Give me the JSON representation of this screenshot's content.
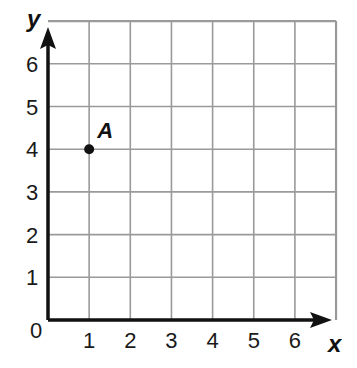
{
  "chart_data": {
    "type": "scatter",
    "title": "",
    "xlabel": "x",
    "ylabel": "y",
    "xlim": [
      0,
      7
    ],
    "ylim": [
      0,
      7
    ],
    "grid": true,
    "x_ticks": [
      "0",
      "1",
      "2",
      "3",
      "4",
      "5",
      "6"
    ],
    "y_ticks": [
      "1",
      "2",
      "3",
      "4",
      "5",
      "6"
    ],
    "origin_label": "0",
    "points": [
      {
        "label": "A",
        "x": 1,
        "y": 4
      }
    ]
  },
  "colors": {
    "grid": "#9a9a9a",
    "axis": "#111111",
    "point": "#111111"
  }
}
